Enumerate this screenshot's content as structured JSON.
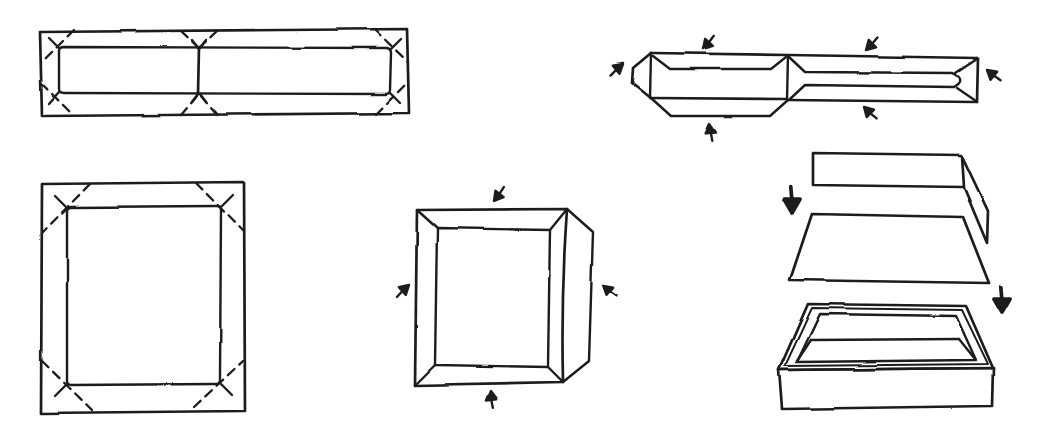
{
  "meta": {
    "style": "black ink sketch on white, no text",
    "background": "#ffffff",
    "ink": "#1c1c1c"
  },
  "panels": [
    {
      "id": "strip-crease-pattern",
      "label": "long strip crease pattern",
      "stage": 1,
      "description": "flat elongated rectangle with inner fold rectangle, centre divider, dashed corner diagonals and dashed centre V-marks"
    },
    {
      "id": "square-crease-pattern",
      "label": "square crease pattern",
      "stage": 2,
      "description": "flat square sheet with inner fold square and dashed 45-degree diagonals across each corner"
    },
    {
      "id": "square-folding-3d",
      "label": "square sheet with edges folding up",
      "stage": 3,
      "description": "3D view of square sheet, four walls raised, right flap still open, four inward arrows"
    },
    {
      "id": "strip-folding-3d",
      "label": "long strip folding into rim",
      "stage": 4,
      "description": "3D view of strip folding lengthwise; left half open, right half nearly closed, six inward arrows"
    },
    {
      "id": "rim-and-base-pieces",
      "label": "rim strip and base panel",
      "stage": 5,
      "description": "folded wall strip with corner bend above flat trapezoid base panel, assembled downward"
    },
    {
      "id": "assembled-tray",
      "label": "finished shallow tray box",
      "stage": 6,
      "description": "open shallow box with double-walled rim seen in perspective"
    }
  ],
  "arrows": {
    "legend": "small arrows = fold inward, large arrows = place downward",
    "items": [
      {
        "panel": "square-folding-3d",
        "direction": "down-left",
        "symbol": "↙",
        "tip": [
          494,
          201
        ],
        "angle": 128,
        "size": "small"
      },
      {
        "panel": "square-folding-3d",
        "direction": "up-right",
        "symbol": "↗",
        "tip": [
          409,
          285
        ],
        "angle": -42,
        "size": "small"
      },
      {
        "panel": "square-folding-3d",
        "direction": "up-left",
        "symbol": "↖",
        "tip": [
          603,
          285
        ],
        "angle": -140,
        "size": "small"
      },
      {
        "panel": "square-folding-3d",
        "direction": "up",
        "symbol": "↑",
        "tip": [
          490,
          391
        ],
        "angle": -97,
        "size": "small"
      },
      {
        "panel": "strip-folding-3d",
        "direction": "up-right",
        "symbol": "↗",
        "tip": [
          623,
          63
        ],
        "angle": -40,
        "size": "small"
      },
      {
        "panel": "strip-folding-3d",
        "direction": "down-left",
        "symbol": "↙",
        "tip": [
          703,
          49
        ],
        "angle": 132,
        "size": "small"
      },
      {
        "panel": "strip-folding-3d",
        "direction": "down-left",
        "symbol": "↙",
        "tip": [
          866,
          50
        ],
        "angle": 135,
        "size": "small"
      },
      {
        "panel": "strip-folding-3d",
        "direction": "up-left",
        "symbol": "↖",
        "tip": [
          987,
          70
        ],
        "angle": -140,
        "size": "small"
      },
      {
        "panel": "strip-folding-3d",
        "direction": "up",
        "symbol": "↑",
        "tip": [
          710,
          124
        ],
        "angle": -95,
        "size": "small"
      },
      {
        "panel": "strip-folding-3d",
        "direction": "up-left",
        "symbol": "↖",
        "tip": [
          864,
          107
        ],
        "angle": -135,
        "size": "small"
      },
      {
        "panel": "rim-and-base-pieces",
        "direction": "down",
        "symbol": "↓",
        "tip": [
          792,
          213
        ],
        "angle": 90,
        "size": "large"
      },
      {
        "panel": "assembled-tray",
        "direction": "down",
        "symbol": "↓",
        "tip": [
          1002,
          313
        ],
        "angle": 90,
        "size": "large"
      }
    ]
  }
}
